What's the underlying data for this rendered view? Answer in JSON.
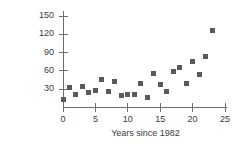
{
  "chart_data": {
    "type": "scatter",
    "title": "",
    "xlabel": "Years since 1982",
    "ylabel": "Acres per fire",
    "xlim": [
      0,
      25
    ],
    "ylim": [
      0,
      160
    ],
    "xticks": [
      0,
      5,
      10,
      15,
      20,
      25
    ],
    "yticks": [
      30,
      60,
      90,
      120,
      150
    ],
    "xtick_labels": [
      "0",
      "5",
      "10",
      "15",
      "20",
      "25"
    ],
    "ytick_labels": [
      "30",
      "60",
      "90",
      "120",
      "150"
    ],
    "grid": false,
    "legend": "none",
    "marker": "square",
    "marker_color": "#5a5a5a",
    "axis_color": "#6e6e6e",
    "background_color": "#ffffff",
    "series": [
      {
        "name": "Acres per fire",
        "points": [
          {
            "x": 0,
            "y": 13
          },
          {
            "x": 1,
            "y": 32
          },
          {
            "x": 2,
            "y": 21
          },
          {
            "x": 3,
            "y": 34
          },
          {
            "x": 4,
            "y": 24
          },
          {
            "x": 5,
            "y": 28
          },
          {
            "x": 6,
            "y": 46
          },
          {
            "x": 7,
            "y": 27
          },
          {
            "x": 8,
            "y": 43
          },
          {
            "x": 9,
            "y": 19
          },
          {
            "x": 10,
            "y": 21
          },
          {
            "x": 11,
            "y": 21
          },
          {
            "x": 12,
            "y": 39
          },
          {
            "x": 13,
            "y": 16
          },
          {
            "x": 14,
            "y": 56
          },
          {
            "x": 15,
            "y": 38
          },
          {
            "x": 16,
            "y": 27
          },
          {
            "x": 17,
            "y": 59
          },
          {
            "x": 18,
            "y": 65
          },
          {
            "x": 19,
            "y": 40
          },
          {
            "x": 20,
            "y": 76
          },
          {
            "x": 21,
            "y": 54
          },
          {
            "x": 22,
            "y": 84
          },
          {
            "x": 23,
            "y": 127
          }
        ]
      }
    ]
  }
}
